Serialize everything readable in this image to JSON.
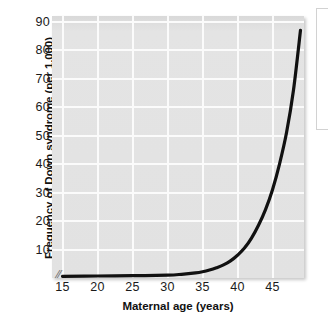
{
  "figure": {
    "background_color": "#ffffff",
    "plot_background_color": "#e2e2e2",
    "gridline_color": "#fbfbfb",
    "curve_color": "#111111",
    "axis_break_mark": "//"
  },
  "chart_data": {
    "type": "line",
    "title": "",
    "xlabel": "Maternal age (years)",
    "ylabel": "Frequency of Down syndrome (per 1,000)",
    "xlim": [
      13.5,
      49.5
    ],
    "ylim": [
      0,
      92
    ],
    "xticks": [
      15,
      20,
      25,
      30,
      35,
      40,
      45
    ],
    "xtick_labels": [
      "15",
      "20",
      "25",
      "30",
      "35",
      "40",
      "45"
    ],
    "yticks": [
      10,
      20,
      30,
      40,
      50,
      60,
      70,
      80,
      90
    ],
    "ytick_labels": [
      "10",
      "20",
      "30",
      "40",
      "50",
      "60",
      "70",
      "80",
      "90"
    ],
    "grid": true,
    "legend": false,
    "axis_break_x": true,
    "series": [
      {
        "name": "Frequency of Down syndrome",
        "x": [
          15,
          20,
          25,
          30,
          32,
          34,
          35,
          36,
          37,
          38,
          39,
          40,
          41,
          42,
          43,
          44,
          45,
          46,
          47,
          48,
          49
        ],
        "values": [
          0.6,
          0.7,
          0.8,
          1.0,
          1.3,
          1.8,
          2.2,
          2.8,
          3.6,
          4.6,
          6.0,
          8.0,
          10.5,
          14.0,
          18.5,
          24.0,
          31.0,
          40.0,
          51.0,
          66.0,
          87.0
        ]
      }
    ]
  }
}
